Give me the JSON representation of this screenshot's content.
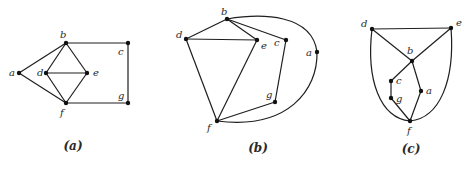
{
  "figure": {
    "panels": [
      {
        "id": "a",
        "caption": "(a)",
        "vertices": [
          {
            "name": "a",
            "label": "a"
          },
          {
            "name": "b",
            "label": "b"
          },
          {
            "name": "c",
            "label": "c"
          },
          {
            "name": "d",
            "label": "d"
          },
          {
            "name": "e",
            "label": "e"
          },
          {
            "name": "f",
            "label": "f"
          },
          {
            "name": "g",
            "label": "g"
          }
        ],
        "edges": [
          [
            "a",
            "b"
          ],
          [
            "a",
            "f"
          ],
          [
            "b",
            "d"
          ],
          [
            "b",
            "e"
          ],
          [
            "d",
            "e"
          ],
          [
            "d",
            "f"
          ],
          [
            "e",
            "f"
          ],
          [
            "b",
            "c"
          ],
          [
            "c",
            "g"
          ],
          [
            "g",
            "f"
          ]
        ],
        "curved_edges": []
      },
      {
        "id": "b",
        "caption": "(b)",
        "vertices": [
          {
            "name": "a",
            "label": "a"
          },
          {
            "name": "b",
            "label": "b"
          },
          {
            "name": "c",
            "label": "c"
          },
          {
            "name": "d",
            "label": "d"
          },
          {
            "name": "e",
            "label": "e"
          },
          {
            "name": "f",
            "label": "f"
          },
          {
            "name": "g",
            "label": "g"
          }
        ],
        "edges": [
          [
            "b",
            "d"
          ],
          [
            "b",
            "e"
          ],
          [
            "b",
            "c"
          ],
          [
            "d",
            "e"
          ],
          [
            "d",
            "f"
          ],
          [
            "e",
            "f"
          ],
          [
            "c",
            "g"
          ],
          [
            "g",
            "f"
          ]
        ],
        "curved_edges": [
          [
            "b",
            "a"
          ],
          [
            "a",
            "f"
          ]
        ]
      },
      {
        "id": "c",
        "caption": "(c)",
        "vertices": [
          {
            "name": "a",
            "label": "a"
          },
          {
            "name": "b",
            "label": "b"
          },
          {
            "name": "c",
            "label": "c"
          },
          {
            "name": "d",
            "label": "d"
          },
          {
            "name": "e",
            "label": "e"
          },
          {
            "name": "f",
            "label": "f"
          },
          {
            "name": "g",
            "label": "g"
          }
        ],
        "edges": [
          [
            "d",
            "e"
          ],
          [
            "d",
            "b"
          ],
          [
            "e",
            "b"
          ],
          [
            "b",
            "c"
          ],
          [
            "c",
            "g"
          ],
          [
            "g",
            "f"
          ],
          [
            "b",
            "a"
          ],
          [
            "a",
            "f"
          ]
        ],
        "curved_edges": [
          [
            "d",
            "f"
          ],
          [
            "e",
            "f"
          ]
        ]
      }
    ]
  }
}
